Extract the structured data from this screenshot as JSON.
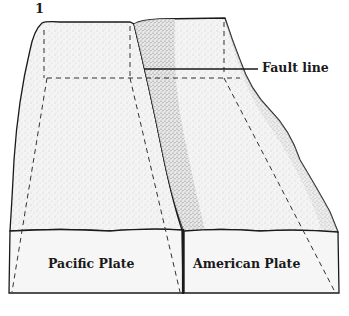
{
  "figure": {
    "number": "1",
    "labels": {
      "fault_line": "Fault line",
      "pacific_plate": "Pacific Plate",
      "american_plate": "American Plate"
    },
    "colors": {
      "outline": "#1a1a1a",
      "top_surface": "#f3f3f3",
      "front_face": "#f6f6f6",
      "stipple": "#8a8a8a",
      "background": "#ffffff"
    }
  }
}
